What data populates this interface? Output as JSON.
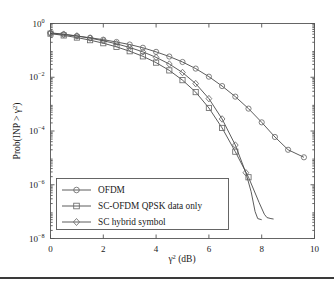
{
  "figure": {
    "background_color": "#ffffff",
    "line_color": "#4a4a4a",
    "marker_color": "#6a6a6a",
    "axis_color": "#555555",
    "footer_rule_color": "#3a3a3a"
  },
  "axes": {
    "x_label_main": "γ",
    "x_label_sup": "2",
    "x_label_unit": " (dB)",
    "y_label_prefix": "Prob(INP > γ",
    "y_label_sup": "2",
    "y_label_suffix": ")",
    "x_ticks": [
      "0",
      "2",
      "4",
      "6",
      "8",
      "10"
    ],
    "y_tick_mantissa": "10",
    "y_tick_exponents": [
      "0",
      "−2",
      "−4",
      "−6",
      "−8"
    ]
  },
  "legend": {
    "entries": [
      {
        "label": "OFDM",
        "marker": "circle-marker"
      },
      {
        "label": "SC-OFDM QPSK data only",
        "marker": "square-marker"
      },
      {
        "label": "SC hybrid symbol",
        "marker": "diamond-marker"
      }
    ]
  },
  "chart_data": {
    "type": "line",
    "title": "",
    "xlabel": "γ² (dB)",
    "ylabel": "Prob(INP > γ²)",
    "xlim": [
      0,
      10
    ],
    "ylim": [
      1e-08,
      1
    ],
    "yscale": "log",
    "xscale": "linear",
    "grid": false,
    "legend_position": "lower-left-inside",
    "series": [
      {
        "name": "OFDM",
        "marker": "circle",
        "x": [
          0.0,
          0.5,
          1.0,
          1.5,
          2.0,
          2.5,
          3.0,
          3.5,
          4.0,
          4.5,
          5.0,
          5.5,
          6.0,
          6.5,
          7.0,
          7.5,
          8.0,
          8.5,
          9.0,
          9.6
        ],
        "y": [
          0.43,
          0.39,
          0.34,
          0.295,
          0.25,
          0.205,
          0.165,
          0.125,
          0.088,
          0.059,
          0.037,
          0.021,
          0.0105,
          0.0047,
          0.0019,
          0.00068,
          0.00021,
          6e-05,
          2e-05,
          1.05e-05
        ]
      },
      {
        "name": "SC-OFDM QPSK data only",
        "marker": "square",
        "x": [
          0.0,
          0.5,
          1.0,
          1.5,
          2.0,
          2.5,
          3.0,
          3.5,
          4.0,
          4.5,
          5.0,
          5.5,
          6.0,
          6.5,
          7.0,
          7.5,
          7.9,
          8.1,
          8.2,
          8.35,
          8.45
        ],
        "y": [
          0.42,
          0.36,
          0.3,
          0.24,
          0.185,
          0.135,
          0.093,
          0.06,
          0.035,
          0.018,
          0.0078,
          0.0028,
          0.00072,
          0.00013,
          1.7e-05,
          1.9e-06,
          2.2e-07,
          8e-08,
          6e-08,
          5.5e-08,
          5.3e-08
        ]
      },
      {
        "name": "SC hybrid symbol",
        "marker": "diamond",
        "x": [
          0.0,
          0.5,
          1.0,
          1.5,
          2.0,
          2.5,
          3.0,
          3.5,
          4.0,
          4.5,
          5.0,
          5.5,
          6.0,
          6.5,
          7.0,
          7.4,
          7.6,
          7.75,
          7.85,
          8.0
        ],
        "y": [
          0.45,
          0.4,
          0.345,
          0.285,
          0.228,
          0.175,
          0.128,
          0.088,
          0.055,
          0.031,
          0.015,
          0.0058,
          0.0016,
          0.00028,
          3e-05,
          2.8e-06,
          5.5e-07,
          1e-07,
          5.5e-08,
          5e-08
        ]
      }
    ]
  }
}
